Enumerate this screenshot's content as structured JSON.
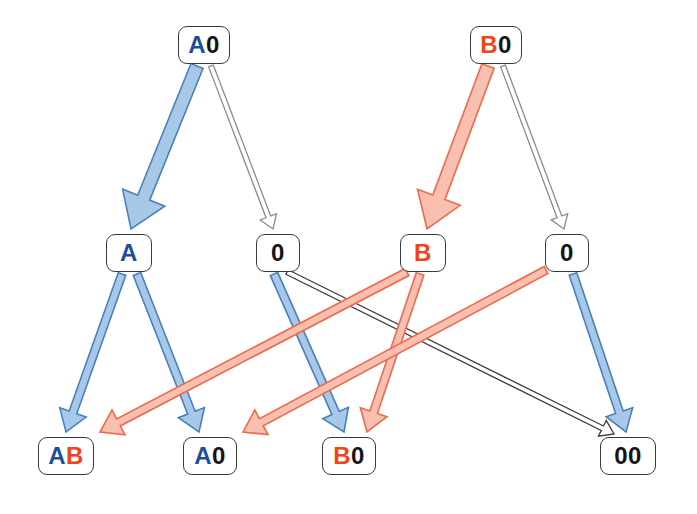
{
  "diagram": {
    "type": "graph",
    "background": "#ffffff",
    "colors": {
      "blue_fill": "#a8c8e8",
      "blue_stroke": "#4a7fc1",
      "red_fill": "#f9bfb0",
      "red_stroke": "#ef6a4a",
      "white_fill": "#ffffff",
      "gray_stroke": "#8a8a8a",
      "black_stroke": "#3a3a3a",
      "node_border": "#3a3a3a",
      "text_blue": "#1b4f9c",
      "text_red": "#f0431a",
      "text_black": "#141414"
    },
    "nodes": [
      {
        "id": "n_a0_top",
        "label": "A0",
        "x": 178,
        "y": 26,
        "w": 52,
        "h": 38,
        "fontsize": 24,
        "chars": [
          {
            "t": "A",
            "color": "blue"
          },
          {
            "t": "0",
            "color": "black"
          }
        ]
      },
      {
        "id": "n_b0_top",
        "label": "B0",
        "x": 470,
        "y": 26,
        "w": 52,
        "h": 38,
        "fontsize": 24,
        "chars": [
          {
            "t": "B",
            "color": "red"
          },
          {
            "t": "0",
            "color": "black"
          }
        ]
      },
      {
        "id": "n_a_mid",
        "label": "A",
        "x": 106,
        "y": 234,
        "w": 46,
        "h": 38,
        "fontsize": 24,
        "chars": [
          {
            "t": "A",
            "color": "blue"
          }
        ]
      },
      {
        "id": "n_0_mid_left",
        "label": "0",
        "x": 256,
        "y": 234,
        "w": 44,
        "h": 38,
        "fontsize": 24,
        "chars": [
          {
            "t": "0",
            "color": "black"
          }
        ]
      },
      {
        "id": "n_b_mid",
        "label": "B",
        "x": 400,
        "y": 234,
        "w": 46,
        "h": 38,
        "fontsize": 24,
        "chars": [
          {
            "t": "B",
            "color": "red"
          }
        ]
      },
      {
        "id": "n_0_mid_right",
        "label": "0",
        "x": 545,
        "y": 234,
        "w": 44,
        "h": 38,
        "fontsize": 24,
        "chars": [
          {
            "t": "0",
            "color": "black"
          }
        ]
      },
      {
        "id": "n_ab_bot",
        "label": "AB",
        "x": 38,
        "y": 437,
        "w": 56,
        "h": 38,
        "fontsize": 24,
        "chars": [
          {
            "t": "A",
            "color": "blue"
          },
          {
            "t": "B",
            "color": "red"
          }
        ]
      },
      {
        "id": "n_a0_bot",
        "label": "A0",
        "x": 183,
        "y": 437,
        "w": 54,
        "h": 38,
        "fontsize": 24,
        "chars": [
          {
            "t": "A",
            "color": "blue"
          },
          {
            "t": "0",
            "color": "black"
          }
        ]
      },
      {
        "id": "n_b0_bot",
        "label": "B0",
        "x": 322,
        "y": 437,
        "w": 54,
        "h": 38,
        "fontsize": 24,
        "chars": [
          {
            "t": "B",
            "color": "red"
          },
          {
            "t": "0",
            "color": "black"
          }
        ]
      },
      {
        "id": "n_00_bot",
        "label": "00",
        "x": 600,
        "y": 437,
        "w": 56,
        "h": 38,
        "fontsize": 24,
        "chars": [
          {
            "t": "0",
            "color": "black"
          },
          {
            "t": "0",
            "color": "black"
          }
        ]
      }
    ],
    "edges": [
      {
        "id": "e_a0_to_a",
        "from": "A0",
        "to": "A",
        "style": "blue",
        "thick": true,
        "x1": 197,
        "y1": 66,
        "x2": 131,
        "y2": 229,
        "w": 13
      },
      {
        "id": "e_a0_to_0left",
        "from": "A0",
        "to": "0",
        "style": "white",
        "thick": false,
        "x1": 211,
        "y1": 66,
        "x2": 273,
        "y2": 229,
        "w": 5
      },
      {
        "id": "e_b0_to_b",
        "from": "B0",
        "to": "B",
        "style": "red",
        "thick": true,
        "x1": 488,
        "y1": 66,
        "x2": 427,
        "y2": 229,
        "w": 13
      },
      {
        "id": "e_b0_to_0right",
        "from": "B0",
        "to": "0",
        "style": "white",
        "thick": false,
        "x1": 503,
        "y1": 66,
        "x2": 564,
        "y2": 229,
        "w": 5
      },
      {
        "id": "e_a_to_ab",
        "from": "A",
        "to": "AB",
        "style": "blue",
        "thick": false,
        "x1": 122,
        "y1": 274,
        "x2": 66,
        "y2": 432,
        "w": 8
      },
      {
        "id": "e_a_to_a0bot",
        "from": "A",
        "to": "A0",
        "style": "blue",
        "thick": false,
        "x1": 137,
        "y1": 274,
        "x2": 199,
        "y2": 432,
        "w": 8
      },
      {
        "id": "e_0left_to_b0bot",
        "from": "0",
        "to": "B0",
        "style": "blue",
        "thick": false,
        "x1": 274,
        "y1": 274,
        "x2": 344,
        "y2": 432,
        "w": 8
      },
      {
        "id": "e_0left_to_00bot",
        "from": "0",
        "to": "00",
        "style": "black",
        "thick": false,
        "x1": 287,
        "y1": 272,
        "x2": 614,
        "y2": 434,
        "w": 5
      },
      {
        "id": "e_b_to_b0bot",
        "from": "B",
        "to": "B0",
        "style": "red",
        "thick": false,
        "x1": 420,
        "y1": 274,
        "x2": 367,
        "y2": 432,
        "w": 8
      },
      {
        "id": "e_b_to_ab_area",
        "from": "B",
        "to": "AB",
        "style": "red",
        "thick": false,
        "x1": 407,
        "y1": 272,
        "x2": 100,
        "y2": 432,
        "w": 8
      },
      {
        "id": "e_0right_to_00bot",
        "from": "0",
        "to": "00",
        "style": "blue",
        "thick": false,
        "x1": 573,
        "y1": 274,
        "x2": 626,
        "y2": 432,
        "w": 8
      },
      {
        "id": "e_0right_to_a0_area",
        "from": "0",
        "to": "A0",
        "style": "red",
        "thick": false,
        "x1": 546,
        "y1": 270,
        "x2": 243,
        "y2": 432,
        "w": 8
      }
    ]
  }
}
